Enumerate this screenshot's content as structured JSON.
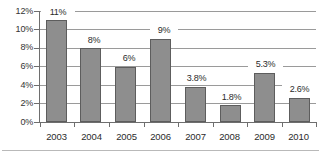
{
  "chart_data": {
    "type": "bar",
    "title": "",
    "subtitle": "",
    "xlabel": "",
    "ylabel": "",
    "categories": [
      "2003",
      "2004",
      "2005",
      "2006",
      "2007",
      "2008",
      "2009",
      "2010"
    ],
    "values": [
      11,
      8,
      6,
      9,
      3.8,
      1.8,
      5.3,
      2.6
    ],
    "data_labels": [
      "11%",
      "8%",
      "6%",
      "9%",
      "3.8%",
      "1.8%",
      "5.3%",
      "2.6%"
    ],
    "series": [
      {
        "name": "",
        "values": [
          11,
          8,
          6,
          9,
          3.8,
          1.8,
          5.3,
          2.6
        ]
      }
    ],
    "ylim": [
      0,
      12
    ],
    "ytick_values": [
      0,
      2,
      4,
      6,
      8,
      10,
      12
    ],
    "ytick_labels": [
      "0%",
      "2%",
      "4%",
      "6%",
      "8%",
      "10%",
      "12%"
    ],
    "grid": true,
    "grid_axis": "y",
    "legend": false,
    "legend_position": "none",
    "bar_color": "#8e8e8e",
    "bar_border_color": "#5d5d5d",
    "grid_color": "#9a9a9a",
    "axis_color": "#6e6e6e",
    "background_color": "#ffffff",
    "text_color": "#2b2b2b"
  }
}
